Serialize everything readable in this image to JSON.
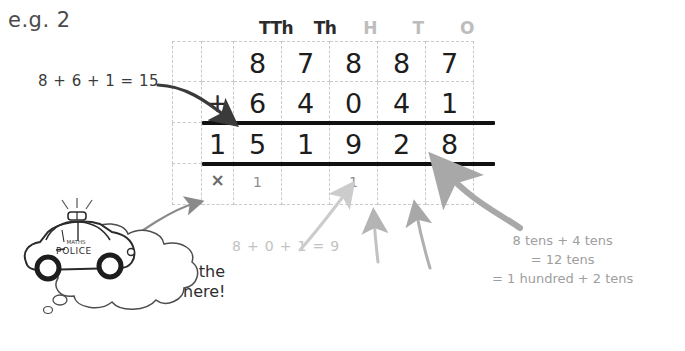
{
  "title": "e.g. 2",
  "colors": {
    "ink_dark": "#1d1d1d",
    "ink_mid": "#6a6a6a",
    "ink_light": "#c2c2c2",
    "arrow_dark": "#3a3a3a",
    "arrow_gray_1": "#c9c9c9",
    "arrow_gray_2": "#9e9e9e",
    "arrow_gray_3": "#8a8a8a",
    "grid_line": "#c9c9c9",
    "rule_line": "#111111"
  },
  "column_headers": [
    {
      "label": "TTh",
      "tone": "dark"
    },
    {
      "label": "Th",
      "tone": "dark"
    },
    {
      "label": "H",
      "tone": "light"
    },
    {
      "label": "T",
      "tone": "light"
    },
    {
      "label": "O",
      "tone": "light"
    }
  ],
  "grid": {
    "columns": 7,
    "rows": 4,
    "rows_data": [
      {
        "name": "addend-row-1",
        "cells": [
          "",
          "",
          "8",
          "7",
          "8",
          "8",
          "7"
        ]
      },
      {
        "name": "operator-row",
        "cells": [
          "",
          "+",
          "6",
          "4",
          "0",
          "4",
          "1"
        ]
      },
      {
        "name": "answer-row",
        "cells": [
          "",
          "1",
          "5",
          "1",
          "9",
          "2",
          "8"
        ]
      },
      {
        "name": "carry-row",
        "cells": [
          "",
          "×",
          "1",
          "",
          "1",
          "",
          ""
        ]
      }
    ]
  },
  "annotations": {
    "left_working": "8 + 6 + 1 = 15",
    "middle_working": "8 + 0 + 1 = 9",
    "right_working_line1": "8 tens + 4 tens",
    "right_working_line2": "= 12 tens",
    "right_working_line3": "= 1 hundred + 2 tens"
  },
  "speech_bubble": {
    "line1_pre": "Do ",
    "line1_emph": "NOT",
    "line1_post": " put the",
    "line2": "carry digit here!"
  },
  "mascot": {
    "name": "maths-police-car",
    "body_label": "POLICE",
    "roof_label": "MATHS"
  }
}
